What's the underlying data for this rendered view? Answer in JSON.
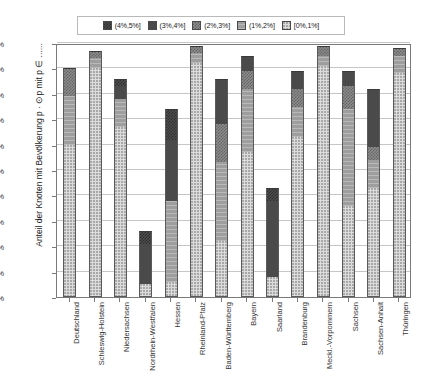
{
  "legend": {
    "position": "top",
    "entries": [
      {
        "label": "(4%,5%]",
        "key": "b4",
        "swatch": "dark-checkered-swatch",
        "color": "#4f4f4f"
      },
      {
        "label": "(3%,4%]",
        "key": "b3",
        "swatch": "dark-solid-swatch",
        "color": "#4a4a4a"
      },
      {
        "label": "(2%,3%]",
        "key": "b2",
        "swatch": "mid-checkered-swatch",
        "color": "#8c8c8c"
      },
      {
        "label": "(1%,2%]",
        "key": "b1",
        "swatch": "gray-solid-swatch",
        "color": "#9e9e9e"
      },
      {
        "label": "[0%,1%]",
        "key": "b0",
        "swatch": "light-dotted-swatch",
        "color": "#dcdcdc"
      }
    ]
  },
  "axes": {
    "ylabel": "Anteil der Knoten mit Bevölkerung p · ⊙p mit p ∈ ......",
    "xlabel": "",
    "yticks": [
      "0%",
      "10%",
      "20%",
      "30%",
      "40%",
      "50%",
      "60%",
      "70%",
      "80%",
      "90%",
      "100%"
    ],
    "ylim": [
      0,
      100
    ],
    "grid": true
  },
  "chart_data": {
    "type": "bar",
    "title": "",
    "subtitle": "",
    "xlabel": "",
    "ylabel": "Anteil der Knoten mit Bevölkerung p · ⊙p mit p ∈ ......",
    "ylim": [
      0,
      100
    ],
    "grid": true,
    "stacked": true,
    "legend_position": "top",
    "categories": [
      "Deutschland",
      "Schleswig-Holstein",
      "Niedersachsen",
      "Nordrhein-Westfalen",
      "Hessen",
      "Rheinland-Pfalz",
      "Baden-Württemberg",
      "Bayern",
      "Saarland",
      "Brandenburg",
      "Meckl.-Vorpommern",
      "Sachsen",
      "Sachsen-Anhalt",
      "Thüringen"
    ],
    "series": [
      {
        "name": "[0%,1%]",
        "key": "b0",
        "values": [
          60.0,
          90.0,
          67.0,
          5.0,
          6.0,
          92.0,
          22.0,
          57.0,
          8.0,
          63.0,
          91.0,
          36.0,
          43.0,
          88.0
        ]
      },
      {
        "name": "(1%,2%]",
        "key": "b1",
        "values": [
          19.0,
          4.0,
          11.0,
          0.0,
          32.0,
          4.0,
          31.0,
          25.0,
          0.0,
          12.0,
          4.0,
          38.0,
          11.0,
          7.0
        ]
      },
      {
        "name": "(2%,3%]",
        "key": "b2",
        "values": [
          11.0,
          3.0,
          0.0,
          0.0,
          0.0,
          3.0,
          15.0,
          7.0,
          0.0,
          7.0,
          4.0,
          9.0,
          5.0,
          3.0
        ]
      },
      {
        "name": "(3%,4%]",
        "key": "b3",
        "values": [
          0.0,
          0.0,
          5.0,
          16.0,
          24.0,
          0.0,
          18.0,
          6.0,
          30.0,
          7.0,
          0.0,
          6.0,
          23.0,
          0.0
        ]
      },
      {
        "name": "(4%,5%]",
        "key": "b4",
        "values": [
          0.0,
          0.0,
          3.0,
          5.0,
          12.0,
          0.0,
          0.0,
          0.0,
          5.0,
          0.0,
          0.0,
          0.0,
          0.0,
          0.0
        ]
      }
    ],
    "totals": [
      90.0,
      97.0,
      86.0,
      26.0,
      74.0,
      99.0,
      86.0,
      95.0,
      43.0,
      89.0,
      99.0,
      89.0,
      82.0,
      98.0
    ]
  }
}
